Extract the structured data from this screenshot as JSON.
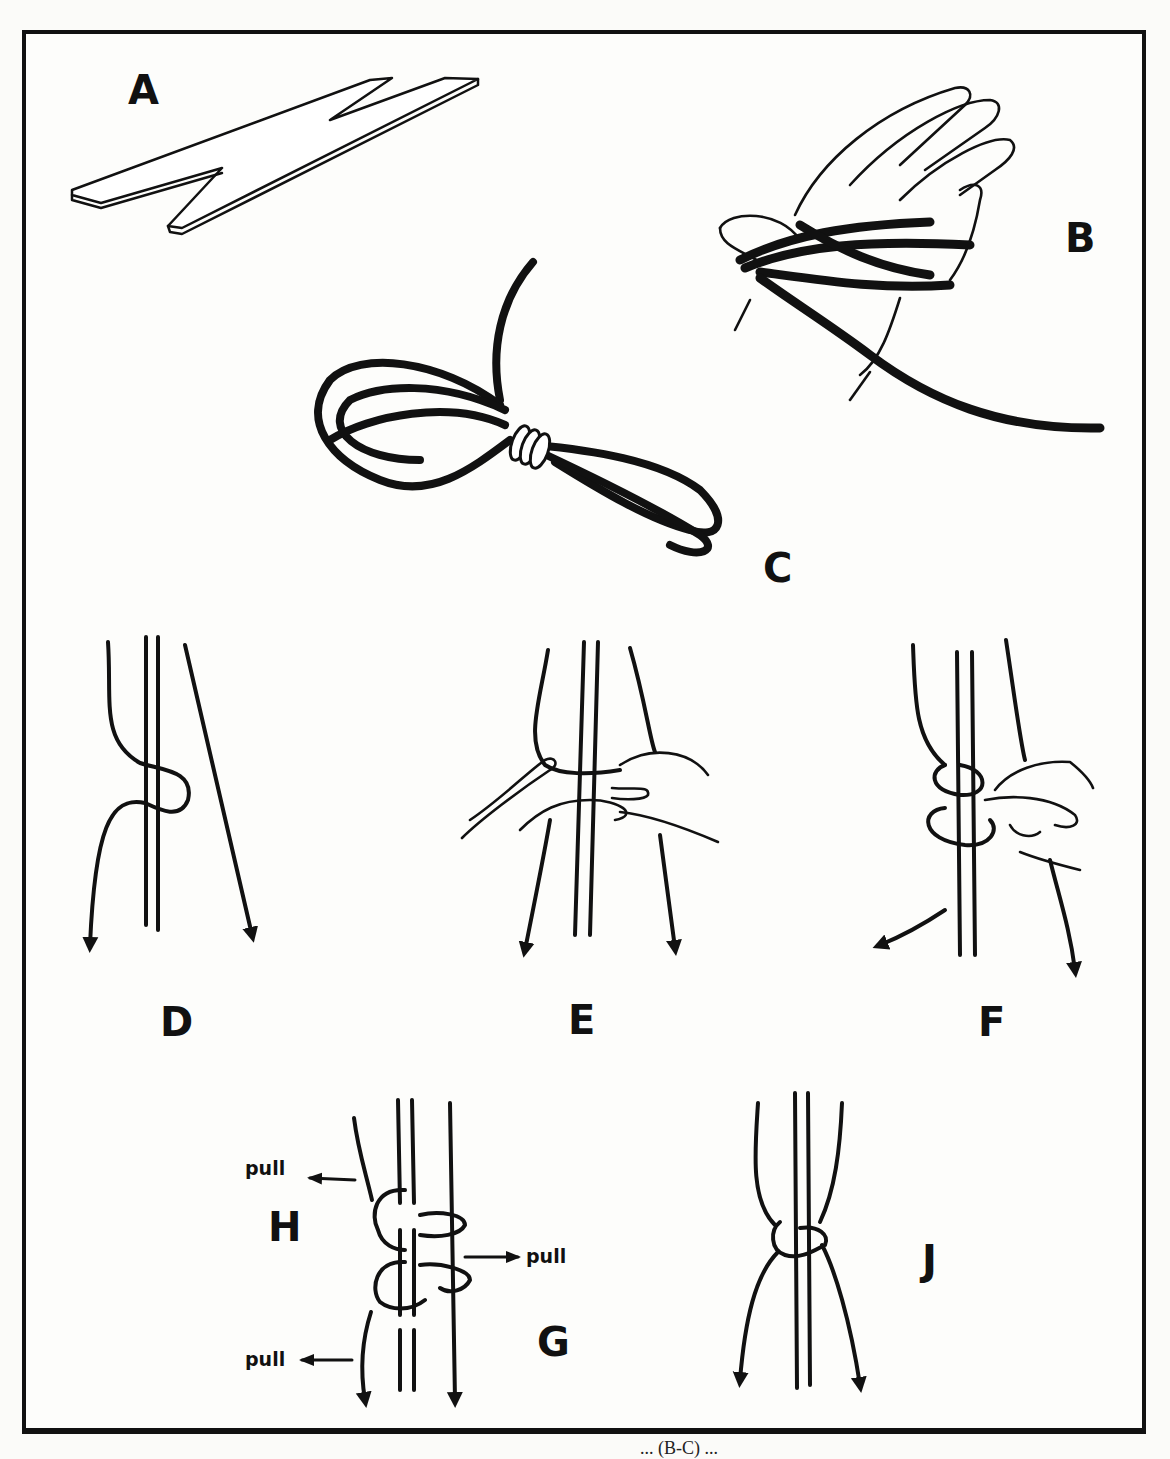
{
  "figure": {
    "panel_labels": {
      "A": "A",
      "B": "B",
      "C": "C",
      "D": "D",
      "E": "E",
      "F": "F",
      "G": "G",
      "H": "H",
      "J": "J"
    },
    "annotations": {
      "pull_top_left": "pull",
      "pull_right": "pull",
      "pull_bottom_left": "pull"
    },
    "panels": [
      {
        "id": "A",
        "depicts": "notched flat wooden strip (card/gauge)"
      },
      {
        "id": "B",
        "depicts": "hand with cord wound in figure-eight around fingers"
      },
      {
        "id": "C",
        "depicts": "figure-eight cord bundle bound with wraps at center"
      },
      {
        "id": "D",
        "depicts": "cord looped around two parallel strands, ends pulled down"
      },
      {
        "id": "E",
        "depicts": "hands forming loop around strands"
      },
      {
        "id": "F",
        "depicts": "hand tightening double loop around strands"
      },
      {
        "id": "G",
        "depicts": "completed wrap around strands"
      },
      {
        "id": "H",
        "depicts": "loops with pull directions indicated"
      },
      {
        "id": "J",
        "depicts": "finished knot on parallel strands, ends pulled down"
      }
    ],
    "caption_fragment": "... (B-C) ..."
  },
  "colors": {
    "ink": "#111111",
    "paper": "#fdfdfb"
  }
}
